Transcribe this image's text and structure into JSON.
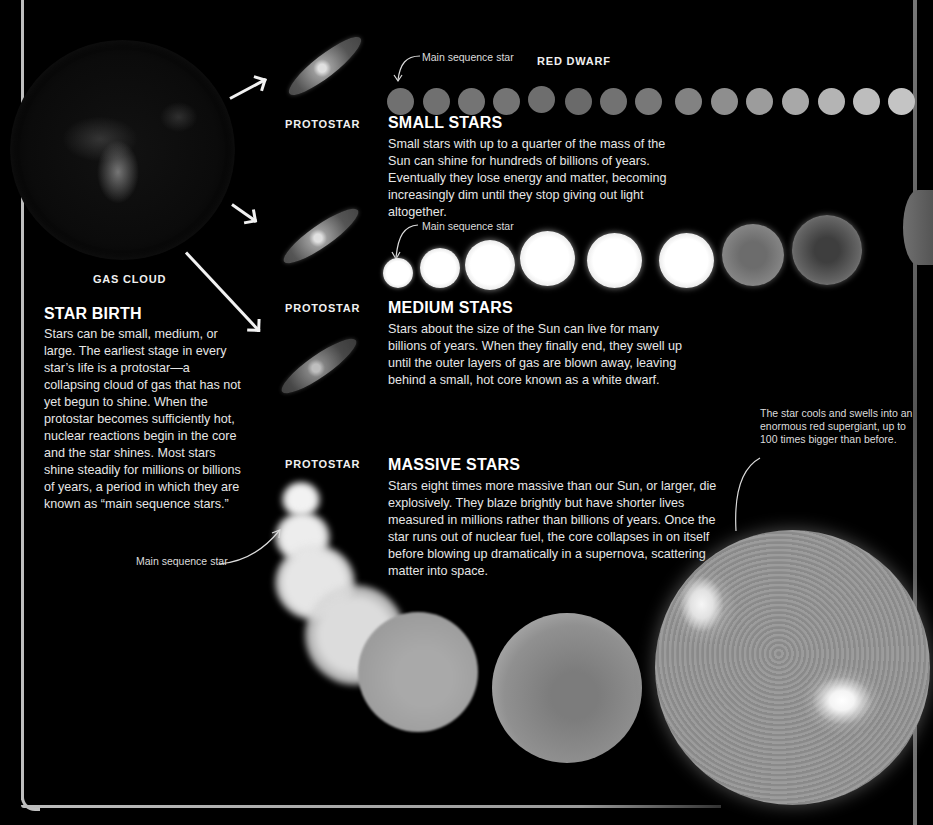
{
  "labels": {
    "gas_cloud": "GAS CLOUD",
    "protostar_1": "PROTOSTAR",
    "protostar_2": "PROTOSTAR",
    "protostar_3": "PROTOSTAR",
    "red_dwarf": "RED DWARF"
  },
  "annotations": {
    "small_main_sequence": "Main sequence star",
    "medium_main_sequence": "Main sequence star",
    "massive_main_sequence": "Main sequence star",
    "supergiant_note": "The star cools and swells into an enormous red supergiant, up to 100 times bigger than before."
  },
  "sections": {
    "star_birth": {
      "heading": "STAR BIRTH",
      "body": "Stars can be small, medium, or large. The earliest stage in every star’s life is a protostar—a collapsing cloud of gas that has not yet begun to shine. When the protostar becomes sufficiently hot, nuclear reactions begin in the core and the star shines. Most stars shine steadily for millions or billions of years, a period in which they are known as “main sequence stars.”"
    },
    "small_stars": {
      "heading": "SMALL STARS",
      "body": "Small stars with up to a quarter of the mass of the Sun can shine for hundreds of billions of years. Eventually they lose energy and matter, becoming increasingly dim until they stop giving out light altogether."
    },
    "medium_stars": {
      "heading": "MEDIUM STARS",
      "body": "Stars about the size of the Sun can live for many billions of years. When they finally end, they swell up until the outer layers of gas are blown away, leaving behind a small, hot core known as a white dwarf."
    },
    "massive_stars": {
      "heading": "MASSIVE STARS",
      "body": "Stars eight times more massive than our Sun, or larger, die explosively. They blaze brightly but have shorter lives measured in millions rather than billions of years. Once the star runs out of nuclear fuel, the core collapses in on itself before blowing up dramatically in a supernova, scattering matter into space."
    }
  },
  "colors": {
    "background": "#000000",
    "text": "#e6e6e6",
    "frame": "#bfbfbf"
  }
}
